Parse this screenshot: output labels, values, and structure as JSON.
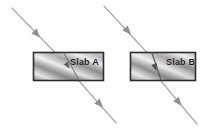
{
  "figure": {
    "kind": "optics-refraction-diagram",
    "width": 208,
    "height": 128,
    "background_color": "#ffffff"
  },
  "slabs": [
    {
      "id": "slab-a",
      "label": "Slab A",
      "x": 33,
      "y": 52,
      "width": 71,
      "height": 29,
      "border_color": "#2b2b2b",
      "fill_light": "#f2f2f2",
      "fill_mid": "#b9b9b9",
      "fill_dark": "#8e8e8e",
      "pattern": "diagonal-metallic-gradient"
    },
    {
      "id": "slab-b",
      "label": "Slab B",
      "x": 130,
      "y": 52,
      "width": 66,
      "height": 29,
      "border_color": "#2b2b2b",
      "fill_light": "#f2f2f2",
      "fill_mid": "#b9b9b9",
      "fill_dark": "#8e8e8e",
      "pattern": "diagonal-metallic-gradient"
    }
  ],
  "rays": [
    {
      "id": "ray-a",
      "through": "Slab A",
      "color": "#a8a8a8",
      "stroke_width": 1.2,
      "incident": {
        "x1": 12,
        "y1": 8,
        "x2": 63,
        "y2": 61
      },
      "inside": {
        "x1": 63,
        "y1": 61,
        "x2": 79,
        "y2": 81
      },
      "emergent": {
        "x1": 79,
        "y1": 81,
        "x2": 115,
        "y2": 122
      },
      "arrowheads": [
        {
          "x": 37,
          "y": 34,
          "angle_deg": 46
        },
        {
          "x": 63,
          "y": 62,
          "angle_deg": 52
        },
        {
          "x": 101,
          "y": 106,
          "angle_deg": 48
        }
      ]
    },
    {
      "id": "ray-b",
      "through": "Slab B",
      "color": "#a8a8a8",
      "stroke_width": 1.2,
      "incident": {
        "x1": 104,
        "y1": 6,
        "x2": 151,
        "y2": 57
      },
      "inside": {
        "x1": 151,
        "y1": 57,
        "x2": 160,
        "y2": 81
      },
      "emergent": {
        "x1": 160,
        "y1": 81,
        "x2": 196,
        "y2": 124
      },
      "arrowheads": [
        {
          "x": 128,
          "y": 32,
          "angle_deg": 47
        },
        {
          "x": 154,
          "y": 67,
          "angle_deg": 69
        },
        {
          "x": 179,
          "y": 103,
          "angle_deg": 50
        }
      ]
    }
  ],
  "colors": {
    "ray": "#a8a8a8",
    "slab_border": "#2b2b2b",
    "label_text": "#1b1b1b",
    "page_background": "#ffffff"
  }
}
